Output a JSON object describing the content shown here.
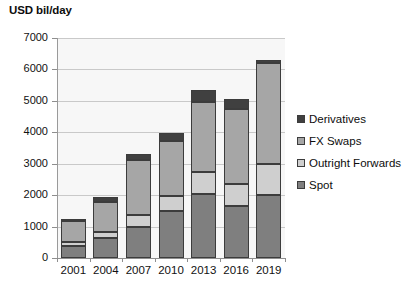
{
  "chart_data": {
    "type": "bar",
    "stacked": true,
    "title": "",
    "ylabel": "USD bil/day",
    "xlabel": "",
    "ylim": [
      0,
      7000
    ],
    "ytick_step": 1000,
    "yticks": [
      "7000",
      "6000",
      "5000",
      "4000",
      "3000",
      "2000",
      "1000",
      "0"
    ],
    "grid": true,
    "legend_position": "right",
    "categories": [
      "2001",
      "2004",
      "2007",
      "2010",
      "2013",
      "2016",
      "2019"
    ],
    "series": [
      {
        "name": "Spot",
        "color": "#7f7f7f",
        "values": [
          390,
          630,
          1000,
          1490,
          2050,
          1650,
          1990
        ]
      },
      {
        "name": "Outright Forwards",
        "color": "#cfcfcf",
        "values": [
          130,
          210,
          360,
          475,
          680,
          700,
          1000
        ]
      },
      {
        "name": "FX Swaps",
        "color": "#a6a6a6",
        "values": [
          650,
          950,
          1760,
          1765,
          2230,
          2380,
          3200
        ]
      },
      {
        "name": "Derivatives",
        "color": "#404040",
        "values": [
          70,
          140,
          200,
          250,
          400,
          340,
          110
        ]
      }
    ],
    "totals": [
      1240,
      1930,
      3320,
      3980,
      5360,
      5070,
      6300
    ]
  },
  "legend": {
    "items": [
      {
        "label": "Derivatives"
      },
      {
        "label": "FX Swaps"
      },
      {
        "label": "Outright Forwards"
      },
      {
        "label": "Spot"
      }
    ]
  }
}
